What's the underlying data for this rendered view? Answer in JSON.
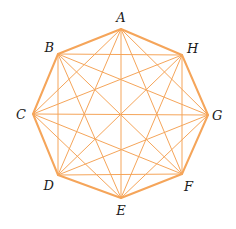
{
  "diagram": {
    "type": "complete-graph",
    "edge_color": "#f5a55a",
    "label_color": "#1a1a1a",
    "vertices": [
      {
        "id": "A",
        "label": "A",
        "x": 121,
        "y": 29,
        "lx": 121,
        "ly": 22,
        "anchor": "middle"
      },
      {
        "id": "H",
        "label": "H",
        "x": 182,
        "y": 55,
        "lx": 187,
        "ly": 53,
        "anchor": "start"
      },
      {
        "id": "G",
        "label": "G",
        "x": 208,
        "y": 115,
        "lx": 212,
        "ly": 120,
        "anchor": "start"
      },
      {
        "id": "F",
        "label": "F",
        "x": 182,
        "y": 174,
        "lx": 184,
        "ly": 191,
        "anchor": "start"
      },
      {
        "id": "E",
        "label": "E",
        "x": 121,
        "y": 198,
        "lx": 121,
        "ly": 215,
        "anchor": "middle"
      },
      {
        "id": "D",
        "label": "D",
        "x": 58,
        "y": 175,
        "lx": 54,
        "ly": 190,
        "anchor": "end"
      },
      {
        "id": "C",
        "label": "C",
        "x": 33,
        "y": 114,
        "lx": 26,
        "ly": 119,
        "anchor": "end"
      },
      {
        "id": "B",
        "label": "B",
        "x": 58,
        "y": 54,
        "lx": 54,
        "ly": 52,
        "anchor": "end"
      }
    ]
  }
}
